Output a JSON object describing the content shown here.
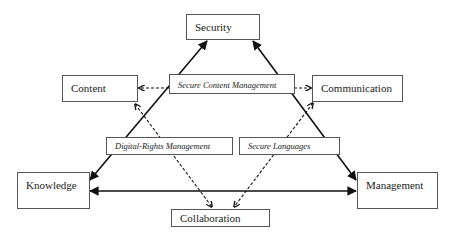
{
  "diagram": {
    "nodes": [
      {
        "id": "security",
        "label": "Security"
      },
      {
        "id": "content",
        "label": "Content"
      },
      {
        "id": "communication",
        "label": "Communication"
      },
      {
        "id": "knowledge",
        "label": "Knowledge"
      },
      {
        "id": "management",
        "label": "Management"
      },
      {
        "id": "collaboration",
        "label": "Collaboration"
      }
    ],
    "mechanisms": [
      {
        "id": "secure-content-management",
        "label": "Secure Content Management"
      },
      {
        "id": "digital-rights-management",
        "label": "Digital-Rights Management"
      },
      {
        "id": "secure-languages",
        "label": "Secure Languages"
      }
    ],
    "edges": [
      {
        "from": "knowledge",
        "to": "security",
        "style": "solid",
        "direction": "both"
      },
      {
        "from": "management",
        "to": "security",
        "style": "solid",
        "direction": "both"
      },
      {
        "from": "knowledge",
        "to": "management",
        "style": "solid",
        "direction": "both"
      },
      {
        "from": "secure-content-management",
        "to": "content",
        "style": "dashed",
        "direction": "forward"
      },
      {
        "from": "secure-content-management",
        "to": "communication",
        "style": "dashed",
        "direction": "forward"
      },
      {
        "from": "content",
        "to": "collaboration",
        "style": "dashed",
        "direction": "both"
      },
      {
        "from": "communication",
        "to": "collaboration",
        "style": "dashed",
        "direction": "both"
      }
    ]
  }
}
